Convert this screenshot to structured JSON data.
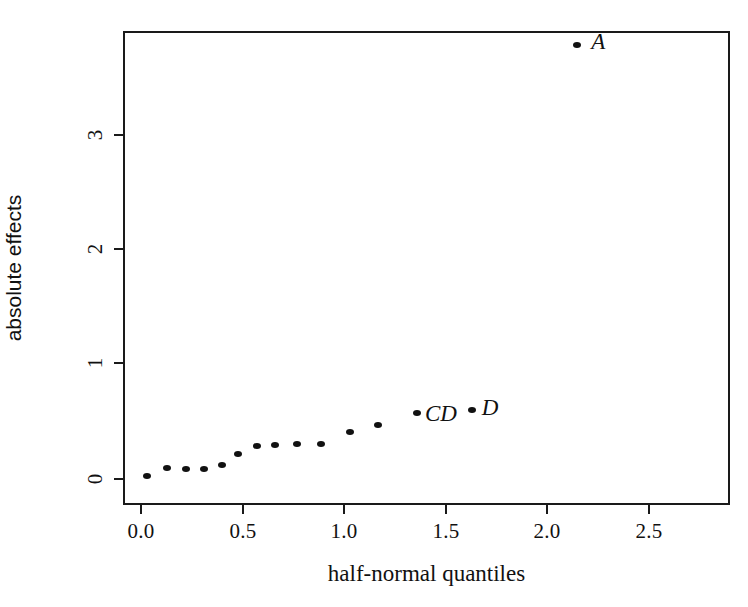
{
  "chart_data": {
    "type": "scatter",
    "title": "",
    "xlabel": "half-normal quantiles",
    "ylabel": "absolute effects",
    "xlim": [
      -0.09,
      2.88
    ],
    "ylim": [
      -0.12,
      3.99
    ],
    "grid": false,
    "legend": null,
    "xticks": [
      "0.0",
      "0.5",
      "1.0",
      "1.5",
      "2.0",
      "2.5"
    ],
    "xtick_values": [
      0.0,
      0.5,
      1.0,
      1.5,
      2.0,
      2.5
    ],
    "yticks": [
      "0",
      "1",
      "2",
      "3"
    ],
    "ytick_values": [
      0,
      1,
      2,
      3
    ],
    "points": [
      {
        "x": 0.03,
        "y": 0.02,
        "label": ""
      },
      {
        "x": 0.13,
        "y": 0.09,
        "label": ""
      },
      {
        "x": 0.22,
        "y": 0.08,
        "label": ""
      },
      {
        "x": 0.31,
        "y": 0.08,
        "label": ""
      },
      {
        "x": 0.4,
        "y": 0.11,
        "label": ""
      },
      {
        "x": 0.48,
        "y": 0.21,
        "label": ""
      },
      {
        "x": 0.57,
        "y": 0.28,
        "label": ""
      },
      {
        "x": 0.66,
        "y": 0.29,
        "label": ""
      },
      {
        "x": 0.77,
        "y": 0.3,
        "label": ""
      },
      {
        "x": 0.89,
        "y": 0.3,
        "label": ""
      },
      {
        "x": 1.03,
        "y": 0.4,
        "label": ""
      },
      {
        "x": 1.17,
        "y": 0.46,
        "label": ""
      },
      {
        "x": 1.36,
        "y": 0.57,
        "label": "CD"
      },
      {
        "x": 1.63,
        "y": 0.59,
        "label": "D"
      },
      {
        "x": 2.15,
        "y": 3.78,
        "label": "A"
      }
    ],
    "annotations": [
      {
        "text": "A",
        "x": 2.22,
        "y": 3.79
      },
      {
        "text": "CD",
        "x": 1.4,
        "y": 0.55
      },
      {
        "text": "D",
        "x": 1.68,
        "y": 0.6
      }
    ]
  },
  "axes": {
    "x_title": "half-normal quantiles",
    "y_title": "absolute effects"
  },
  "labels": {
    "a": "A",
    "cd": "CD",
    "d": "D"
  }
}
